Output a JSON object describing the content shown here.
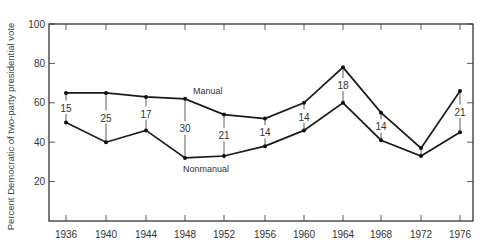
{
  "chart_data": {
    "type": "line",
    "title": "",
    "xlabel": "",
    "ylabel": "Percent Democratic of two-party presidential vote",
    "ylim": [
      0,
      100
    ],
    "yticks": [
      20,
      40,
      60,
      80,
      100
    ],
    "grid": false,
    "legend": "inline labels",
    "categories": [
      "1936",
      "1940",
      "1944",
      "1948",
      "1952",
      "1956",
      "1960",
      "1964",
      "1968",
      "1972",
      "1976"
    ],
    "series": [
      {
        "name": "Manual",
        "values": [
          65,
          65,
          63,
          62,
          54,
          52,
          60,
          78,
          55,
          37,
          66
        ]
      },
      {
        "name": "Nonmanual",
        "values": [
          50,
          40,
          46,
          32,
          33,
          38,
          46,
          60,
          41,
          33,
          45
        ]
      }
    ],
    "annotations": {
      "gap_labels": [
        "15",
        "25",
        "17",
        "30",
        "21",
        "14",
        "14",
        "18",
        "14",
        "",
        "21"
      ]
    }
  }
}
